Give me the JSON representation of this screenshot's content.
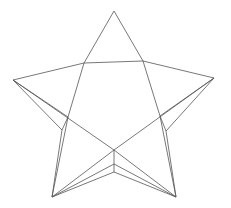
{
  "figure": {
    "stroke_color": "#555555",
    "background": "#ffffff",
    "vertices": {
      "top": [
        114,
        11
      ],
      "left": [
        13,
        80
      ],
      "right": [
        214,
        78
      ],
      "bottom_left": [
        52,
        197
      ],
      "bottom_right": [
        176,
        197
      ],
      "inner_top_left": [
        84,
        63
      ],
      "inner_top_right": [
        143,
        61
      ],
      "inner_left": [
        68,
        117
      ],
      "inner_right": [
        160,
        116
      ],
      "center": [
        114,
        150
      ],
      "left_fold": [
        62,
        130
      ],
      "right_fold": [
        166,
        131
      ],
      "center_fold_1": [
        114,
        164
      ],
      "center_fold_2": [
        114,
        172
      ]
    }
  }
}
